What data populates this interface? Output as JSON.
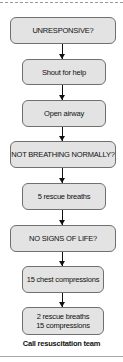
{
  "flowchart": {
    "steps": [
      {
        "label": "UNRESPONSIVE?",
        "type": "decision"
      },
      {
        "label": "Shout for help",
        "type": "action"
      },
      {
        "label": "Open airway",
        "type": "action"
      },
      {
        "label": "NOT BREATHING NORMALLY?",
        "type": "decision"
      },
      {
        "label": "5 rescue breaths",
        "type": "action"
      },
      {
        "label": "NO SIGNS OF LIFE?",
        "type": "decision"
      },
      {
        "label": "15 chest compressions",
        "type": "action"
      },
      {
        "label_line1": "2 rescue breaths",
        "label_line2": "15 compressions",
        "type": "action"
      }
    ],
    "footer": "Call resuscitation team"
  },
  "colors": {
    "box_fill": "#e3e3e3",
    "box_border": "#6f6f6f",
    "arrow": "#111111"
  }
}
